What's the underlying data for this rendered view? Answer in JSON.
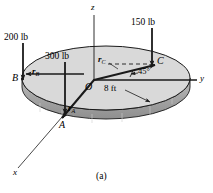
{
  "figure": {
    "caption": "(a)",
    "type": "statics free-body diagram of a circular disk with three vertical loads"
  },
  "axes": {
    "z_label": "z",
    "y_label": "y",
    "x_label": "x",
    "origin_label": "O"
  },
  "disk": {
    "radius_label": "8 ft",
    "top_color": "#d9d9d9",
    "rim_color": "#a8a8a8",
    "outline_color": "#1a1a1a"
  },
  "points": {
    "a": "A",
    "b": "B",
    "c": "C"
  },
  "loads": [
    {
      "id": "load-200",
      "label": "200 lb",
      "point": "B",
      "direction": "down"
    },
    {
      "id": "load-300",
      "label": "300 lb",
      "point": "A",
      "direction": "down"
    },
    {
      "id": "load-150",
      "label": "150 lb",
      "point": "C",
      "direction": "down"
    }
  ],
  "vectors": [
    {
      "id": "r-a",
      "symbol": "r",
      "subscript": "A",
      "to": "A"
    },
    {
      "id": "r-b",
      "symbol": "r",
      "subscript": "B",
      "to": "B"
    },
    {
      "id": "r-c",
      "symbol": "r",
      "subscript": "C",
      "to": "C"
    }
  ],
  "angles": [
    {
      "id": "angle-45",
      "label": "45°",
      "between": "y-axis and r_C"
    }
  ],
  "colors": {
    "ink": "#1a1a1a",
    "background": "#ffffff"
  }
}
